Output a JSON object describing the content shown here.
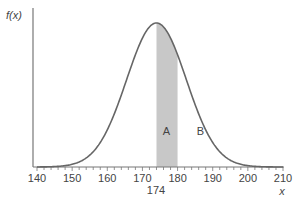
{
  "chart_data": {
    "type": "area",
    "title": "",
    "xlabel": "x",
    "ylabel": "f(x)",
    "distribution": "normal",
    "mean": 174,
    "sd": 8.5,
    "xlim": [
      140,
      210
    ],
    "xticks": [
      140,
      150,
      160,
      170,
      180,
      190,
      200,
      210
    ],
    "tick_labels": [
      "140",
      "150",
      "160",
      "170",
      "180",
      "190",
      "200",
      "210"
    ],
    "minor_tick_step": 2,
    "extra_label": "174",
    "shaded_region": {
      "from": 174,
      "to": 180,
      "color": "#c8c8c8"
    },
    "annotations": [
      {
        "text": "A",
        "x": 176.8
      },
      {
        "text": "B",
        "x": 186.5
      }
    ],
    "grid": false,
    "line_color": "#666666"
  }
}
